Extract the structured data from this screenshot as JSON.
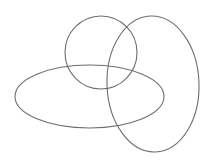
{
  "diagram": {
    "width": 213,
    "height": 164,
    "background": "#ffffff",
    "stroke_color": "#6e6e6e",
    "stroke_width": 1.1,
    "shapes": [
      {
        "name": "circle",
        "type": "ellipse",
        "cx": 101,
        "cy": 52.5,
        "rx": 36,
        "ry": 36.5,
        "rotate": 0
      },
      {
        "name": "horizontal-ellipse",
        "type": "ellipse",
        "cx": 89.5,
        "cy": 96.5,
        "rx": 74.5,
        "ry": 31.5,
        "rotate": 0
      },
      {
        "name": "vertical-ellipse",
        "type": "ellipse",
        "cx": 153,
        "cy": 84,
        "rx": 46,
        "ry": 68,
        "rotate": -2
      }
    ]
  }
}
